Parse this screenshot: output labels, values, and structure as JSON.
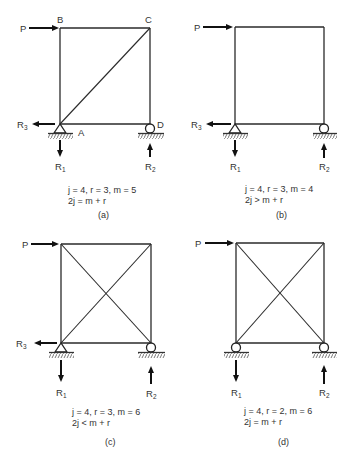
{
  "figure": {
    "panels": [
      {
        "id": "a",
        "label": "(a)",
        "load_label": "P",
        "joint_labels": {
          "top_left": "B",
          "top_right": "C",
          "bottom_left": "A",
          "bottom_right": "D"
        },
        "reactions": {
          "r1": "R",
          "r1_sub": "1",
          "r2": "R",
          "r2_sub": "2",
          "r3": "R",
          "r3_sub": "3"
        },
        "supports": {
          "left": "pin",
          "right": "roller"
        },
        "members": [
          "top",
          "left",
          "right",
          "bottom",
          "diagonal A-C"
        ],
        "caption_line1": "j = 4, r = 3, m = 5",
        "caption_line2": "2j = m + r"
      },
      {
        "id": "b",
        "label": "(b)",
        "load_label": "P",
        "reactions": {
          "r1": "R",
          "r1_sub": "1",
          "r2": "R",
          "r2_sub": "2",
          "r3": "R",
          "r3_sub": "3"
        },
        "supports": {
          "left": "pin",
          "right": "roller"
        },
        "members": [
          "top",
          "left",
          "right",
          "bottom"
        ],
        "caption_line1": "j = 4, r = 3, m = 4",
        "caption_line2": "2j > m + r"
      },
      {
        "id": "c",
        "label": "(c)",
        "load_label": "P",
        "reactions": {
          "r1": "R",
          "r1_sub": "1",
          "r2": "R",
          "r2_sub": "2",
          "r3": "R",
          "r3_sub": "3"
        },
        "supports": {
          "left": "pin",
          "right": "roller"
        },
        "members": [
          "top",
          "left",
          "right",
          "bottom",
          "diagonal 1",
          "diagonal 2"
        ],
        "caption_line1": "j = 4, r = 3, m = 6",
        "caption_line2": "2j < m + r"
      },
      {
        "id": "d",
        "label": "(d)",
        "load_label": "P",
        "reactions": {
          "r1": "R",
          "r1_sub": "1",
          "r2": "R",
          "r2_sub": "2"
        },
        "supports": {
          "left": "roller",
          "right": "roller"
        },
        "members": [
          "top",
          "left",
          "right",
          "bottom",
          "diagonal 1",
          "diagonal 2"
        ],
        "caption_line1": "j = 4, r = 2, m = 6",
        "caption_line2": "2j = m + r"
      }
    ]
  }
}
